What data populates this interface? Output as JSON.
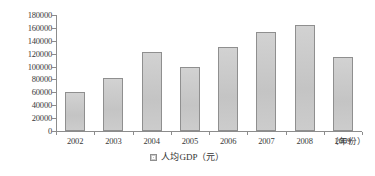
{
  "chart_data": {
    "type": "bar",
    "title": "",
    "subtitle": "",
    "xlabel": "（年份）",
    "ylabel": "",
    "categories": [
      "2002",
      "2003",
      "2004",
      "2005",
      "2006",
      "2007",
      "2008",
      "2009"
    ],
    "values": [
      60000,
      82000,
      122000,
      100000,
      130000,
      153000,
      165000,
      115000
    ],
    "series": [
      {
        "name": "人均GDP（元）",
        "values": [
          60000,
          82000,
          122000,
          100000,
          130000,
          153000,
          165000,
          115000
        ]
      }
    ],
    "ylim": [
      0,
      180000
    ],
    "ytick_values": [
      0,
      20000,
      40000,
      60000,
      80000,
      100000,
      120000,
      140000,
      160000,
      180000
    ],
    "ytick_labels": [
      "0",
      "20000",
      "40000",
      "60000",
      "80000",
      "100000",
      "120000",
      "140000",
      "160000",
      "180000"
    ],
    "grid": false,
    "legend": {
      "position": "bottom",
      "entries": [
        {
          "label": "人均GDP（元）",
          "swatch_name": "legend-swatch-renjun-gdp",
          "color": "#c9c9c9"
        }
      ]
    },
    "colors": {
      "bar_fill": "#c9c9c9",
      "bar_border": "#8f8f8f",
      "axis": "#8c8c8c",
      "text": "#3a3a3a",
      "background": "#ffffff"
    }
  },
  "axis": {
    "x_unit_label": "（年份）"
  },
  "legend": {
    "label": "人均GDP（元）"
  }
}
